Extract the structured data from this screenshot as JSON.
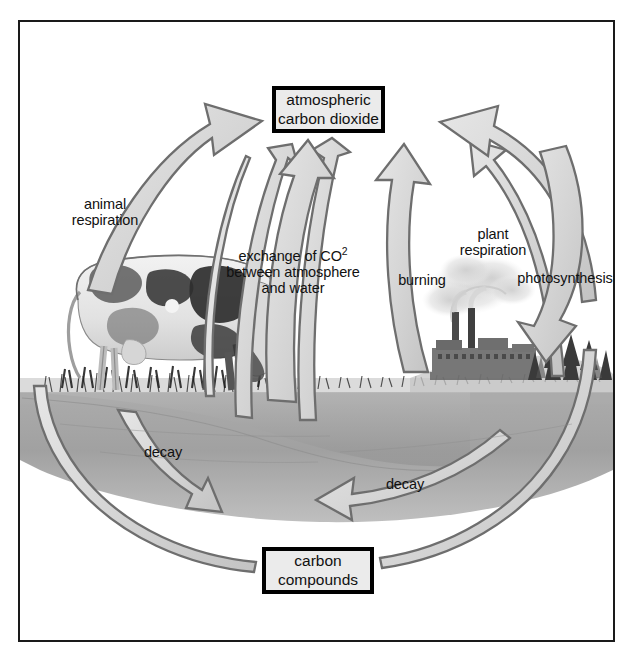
{
  "diagram": {
    "nodes": {
      "atmosphere": {
        "line1": "atmospheric",
        "line2": "carbon dioxide"
      },
      "carbon": {
        "line1": "carbon",
        "line2": "compounds"
      }
    },
    "labels": {
      "animal_respiration": {
        "line1": "animal",
        "line2": "respiration"
      },
      "exchange": {
        "line1": "exchange of CO",
        "sup": "2",
        "line2": "between atmosphere",
        "line3": "and water"
      },
      "burning": "burning",
      "plant_respiration": {
        "line1": "plant",
        "line2": "respiration"
      },
      "photosynthesis": "photosynthesis",
      "decay_left": "decay",
      "decay_right": "decay"
    },
    "scene": {
      "cow": "grazing-cow-illustration",
      "factory": "factory-with-smokestacks-illustration",
      "trees": "conifer-trees-illustration",
      "grass": "grass-line",
      "water": "water-body"
    },
    "colors": {
      "frame_border": "#1a1a1a",
      "node_fill": "#ebebeb",
      "node_border": "#000000",
      "arrow_outline": "#6e6e6e",
      "arrow_fill": "#d8d8d8",
      "water": "#9a9a9a",
      "ground": "#b4b4b4",
      "text": "#111111"
    }
  }
}
